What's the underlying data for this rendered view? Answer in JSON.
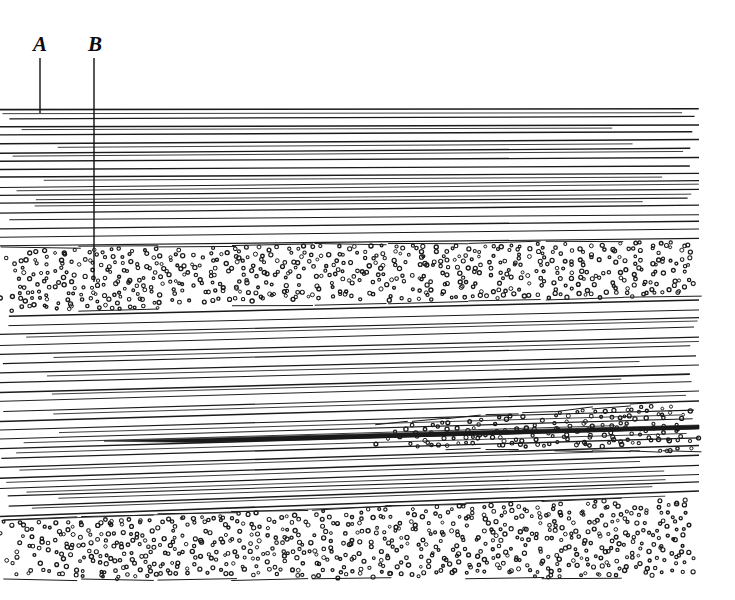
{
  "figure": {
    "name": "stratigraphic-cross-section",
    "type": "geologic-cross-section",
    "background_color": "#ffffff",
    "line_color": "#1a1a1a",
    "stipple_color": "#1a1a1a",
    "width": 735,
    "height": 600,
    "drawing_bounds": {
      "left": 0,
      "right": 699,
      "top": 108,
      "bottom": 580
    }
  },
  "annotations": {
    "labels": [
      {
        "id": "label-a",
        "text": "A",
        "text_x": 40,
        "text_y": 51,
        "leader": {
          "x": 40,
          "y_top": 58,
          "y_bottom": 113
        }
      },
      {
        "id": "label-b",
        "text": "B",
        "text_x": 95,
        "text_y": 51,
        "leader": {
          "x": 94,
          "y_top": 58,
          "y_bottom": 282
        }
      }
    ]
  },
  "chart_data": {
    "type": "diagram",
    "title": "",
    "xlabel": "",
    "ylabel": "",
    "units": "pixels",
    "lithologies": [
      {
        "code": "shale",
        "name": "laminated shale / mudstone",
        "pattern": "horizontal-lines"
      },
      {
        "code": "sandstone",
        "name": "sandstone",
        "pattern": "open-circle-stipple"
      }
    ],
    "units_stack": [
      {
        "id": "unit-shale-upper",
        "lithology": "shale",
        "order": 1,
        "top_left_y": 110,
        "top_right_y": 108,
        "base_left_y": 246,
        "base_right_y": 238,
        "line_count": 17,
        "dip_note": "near-horizontal, very slight rise to the right"
      },
      {
        "id": "unit-sand-upper",
        "lithology": "sandstone",
        "order": 2,
        "x_start": 0,
        "x_end": 699,
        "top_left_y": 248,
        "top_right_y": 240,
        "base_left_y": 312,
        "base_right_y": 296,
        "thickness_left": 64,
        "thickness_right": 56,
        "extent": "full-width tabular body"
      },
      {
        "id": "unit-shale-middle",
        "lithology": "shale",
        "order": 3,
        "top_left_y": 316,
        "top_right_y": 300,
        "base_left_y": 516,
        "base_right_y": 492,
        "line_count": 22,
        "dip_note": "beds dip gently, rising to the right about 3-5 degrees",
        "features": [
          {
            "id": "pinch-out-wedge",
            "type": "wedge-pinchout",
            "tip_x": 104,
            "tip_y": 441,
            "wide_x": 200,
            "note": "thin lens tapering to a point toward the left"
          }
        ]
      },
      {
        "id": "unit-sand-middle-lens",
        "lithology": "sandstone",
        "order": 4,
        "x_start": 375,
        "x_end": 699,
        "top_left_y": 424,
        "top_right_y": 400,
        "base_left_y": 448,
        "base_right_y": 452,
        "shape": "lenticular, tapers to the left, thickens to the right",
        "max_thickness": 52
      },
      {
        "id": "unit-sand-lower",
        "lithology": "sandstone",
        "order": 5,
        "x_start": 0,
        "x_end": 699,
        "top_left_y": 520,
        "top_right_y": 496,
        "base_left_y": 580,
        "base_right_y": 578,
        "extent": "full-width basal sand with irregular upper contact"
      }
    ]
  }
}
